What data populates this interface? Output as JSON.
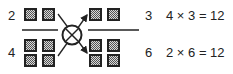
{
  "diagram": {
    "left_fraction": {
      "numerator": "2",
      "denominator": "4",
      "numerator_squares": 2,
      "denominator_squares": 4
    },
    "right_fraction": {
      "numerator": "3",
      "denominator": "6",
      "numerator_squares": 2,
      "denominator_squares": 4
    },
    "operator": "cross-multiply",
    "equations": [
      {
        "text": "4 × 3 = 12"
      },
      {
        "text": "2 × 6 = 12"
      }
    ],
    "colors": {
      "square_fill": "#8a8a8a",
      "square_border": "#222222",
      "line": "#222222"
    }
  }
}
